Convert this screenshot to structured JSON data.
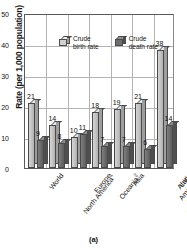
{
  "chart_data": {
    "type": "bar",
    "title": "",
    "subtitle": "",
    "xlabel": "",
    "ylabel": "Rate (per 1,000 population)",
    "ylim": [
      0,
      50
    ],
    "yticks": [
      0,
      10,
      20,
      30,
      40,
      50
    ],
    "grid": true,
    "legend_position": "top-inside",
    "categories": [
      "World",
      "North America¹",
      "Europe",
      "Oceania²",
      "Asia",
      "Latin America\nand the\nCaribbean",
      "Africa"
    ],
    "category_footnotes": {
      "North America": "1",
      "Oceania": "2"
    },
    "series": [
      {
        "name": "Crude birth rate",
        "color": "#c2c2c2",
        "values": [
          21,
          14,
          10,
          18,
          19,
          21,
          38
        ]
      },
      {
        "name": "Crude death rate",
        "color": "#6b6b6b",
        "values": [
          9,
          8,
          11,
          7,
          7,
          6,
          14
        ]
      }
    ],
    "annotations": [
      "(a)"
    ]
  },
  "legend": {
    "items": [
      {
        "label": "Crude\nbirth rate",
        "swatch": "cube-light-icon"
      },
      {
        "label": "Crude\ndeath rate",
        "swatch": "cube-dark-icon"
      }
    ]
  },
  "caption": "(a)"
}
